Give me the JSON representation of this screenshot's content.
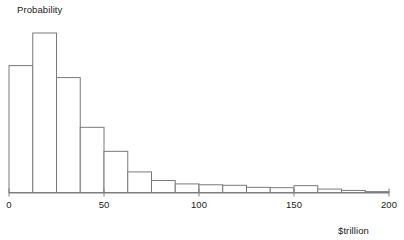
{
  "chart_data": {
    "type": "bar",
    "title": "",
    "subtitle": "",
    "ylabel": "Probability",
    "xlabel": "$trillion",
    "grid": false,
    "legend": null,
    "xlim": [
      0,
      200
    ],
    "ylim": [
      0,
      1
    ],
    "bin_width": 12.5,
    "bin_edges": [
      0,
      12.5,
      25,
      37.5,
      50,
      62.5,
      75,
      87.5,
      100,
      112.5,
      125,
      137.5,
      150,
      162.5,
      175,
      187.5,
      200
    ],
    "categories": [
      "0-12.5",
      "12.5-25",
      "25-37.5",
      "37.5-50",
      "50-62.5",
      "62.5-75",
      "75-87.5",
      "87.5-100",
      "100-112.5",
      "112.5-125",
      "125-137.5",
      "137.5-150",
      "150-162.5",
      "162.5-175",
      "175-187.5",
      "187.5-200"
    ],
    "values": [
      0.74,
      0.93,
      0.67,
      0.38,
      0.24,
      0.12,
      0.07,
      0.05,
      0.045,
      0.042,
      0.03,
      0.028,
      0.04,
      0.02,
      0.012,
      0.005
    ],
    "xticks": [
      0,
      50,
      100,
      150,
      200
    ],
    "xtick_labels": [
      "0",
      "50",
      "100",
      "150",
      "200"
    ],
    "yticks": [],
    "ytick_labels": [],
    "axis_color": "#808080",
    "bar_edge_color": "#7a7a7a",
    "bar_fill_color": "#ffffff",
    "text_color": "#1a1a1a"
  }
}
